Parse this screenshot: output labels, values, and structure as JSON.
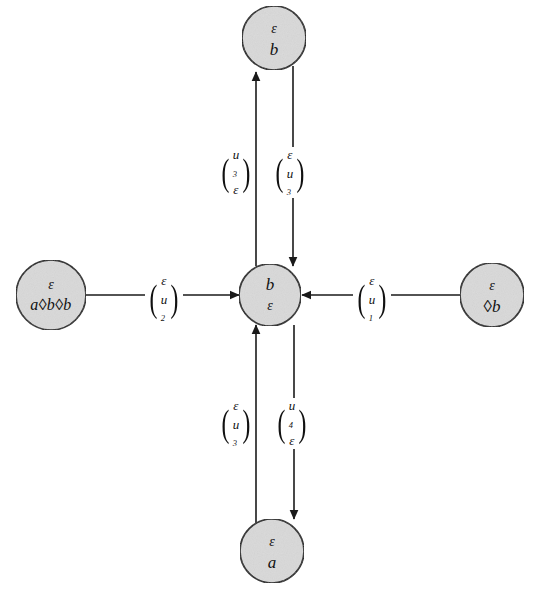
{
  "figure": {
    "type": "state-transition-diagram",
    "background_color": "#ffffff",
    "node_fill_color": "#d9d9d9",
    "node_stroke_color": "#1a1a1a",
    "edge_color": "#1a1a1a"
  },
  "nodes": [
    {
      "id": "top",
      "name": "node-top",
      "top_text": "ε",
      "bottom_text": "b",
      "cx": 274,
      "cy": 38,
      "r": 32
    },
    {
      "id": "left",
      "name": "node-left",
      "top_text": "ε",
      "bottom_text": "a◊b◊b",
      "cx": 51,
      "cy": 295,
      "r": 35
    },
    {
      "id": "center",
      "name": "node-center",
      "top_text": "b",
      "bottom_text": "ε",
      "cx": 270,
      "cy": 295,
      "r": 31
    },
    {
      "id": "right",
      "name": "node-right",
      "top_text": "ε",
      "bottom_text": "◊b",
      "cx": 492,
      "cy": 295,
      "r": 32
    },
    {
      "id": "bottom",
      "name": "node-bottom",
      "top_text": "ε",
      "bottom_text": "a",
      "cx": 272,
      "cy": 551,
      "r": 32
    }
  ],
  "edges": [
    {
      "id": "center-to-top",
      "name": "edge-center-to-top",
      "from": "center",
      "to": "top",
      "direction": "up",
      "upper_symbol": "u",
      "upper_subscript": "3",
      "lower_symbol": "ε",
      "lower_subscript": "",
      "label_x": 240,
      "label_y": 169
    },
    {
      "id": "top-to-center",
      "name": "edge-top-to-center",
      "from": "top",
      "to": "center",
      "direction": "down",
      "upper_symbol": "ε",
      "upper_subscript": "",
      "lower_symbol": "u",
      "lower_subscript": "3",
      "label_x": 295,
      "label_y": 169
    },
    {
      "id": "left-to-center",
      "name": "edge-left-to-center",
      "from": "left",
      "to": "center",
      "direction": "right",
      "upper_symbol": "ε",
      "upper_subscript": "",
      "lower_symbol": "u",
      "lower_subscript": "2",
      "label_x": 168,
      "label_y": 295
    },
    {
      "id": "right-to-center",
      "name": "edge-right-to-center",
      "from": "right",
      "to": "center",
      "direction": "left",
      "upper_symbol": "ε",
      "upper_subscript": "",
      "lower_symbol": "u",
      "lower_subscript": "1",
      "label_x": 376,
      "label_y": 295
    },
    {
      "id": "bottom-to-center",
      "name": "edge-bottom-to-center",
      "from": "bottom",
      "to": "center",
      "direction": "up",
      "upper_symbol": "ε",
      "upper_subscript": "",
      "lower_symbol": "u",
      "lower_subscript": "3",
      "label_x": 240,
      "label_y": 420
    },
    {
      "id": "center-to-bottom",
      "name": "edge-center-to-bottom",
      "from": "center",
      "to": "bottom",
      "direction": "down",
      "upper_symbol": "u",
      "upper_subscript": "4",
      "lower_symbol": "ε",
      "lower_subscript": "",
      "label_x": 296,
      "label_y": 420
    }
  ]
}
